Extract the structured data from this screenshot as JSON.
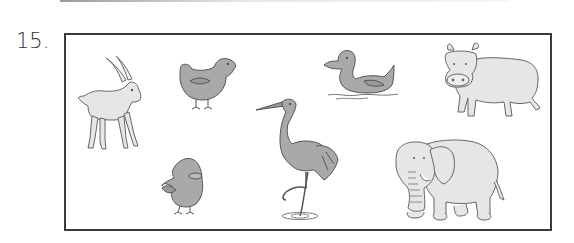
{
  "question": {
    "number": "15."
  },
  "colors": {
    "outline": "#555555",
    "dark_fill": "#a9a9a9",
    "light_fill": "#e6e6e6",
    "frame": "#3a3a3a"
  },
  "animals": [
    {
      "name": "goat",
      "fill": "light"
    },
    {
      "name": "hen",
      "fill": "dark"
    },
    {
      "name": "duck",
      "fill": "dark"
    },
    {
      "name": "cow",
      "fill": "light"
    },
    {
      "name": "chick",
      "fill": "dark"
    },
    {
      "name": "heron",
      "fill": "dark"
    },
    {
      "name": "elephant",
      "fill": "light"
    }
  ]
}
